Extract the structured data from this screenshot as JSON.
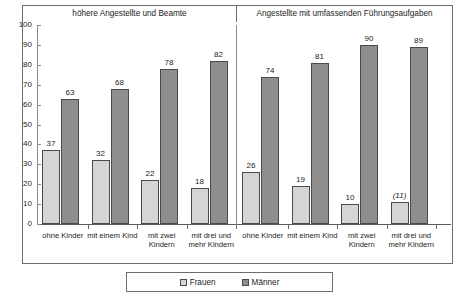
{
  "chart_data": {
    "type": "bar",
    "title": "",
    "xlabel": "",
    "ylabel": "",
    "ylim": [
      0,
      100
    ],
    "ytick_values": [
      0,
      10,
      20,
      30,
      40,
      50,
      60,
      70,
      80,
      90,
      100
    ],
    "ytick_labels": [
      "0",
      "10",
      "20",
      "30",
      "40",
      "50",
      "60",
      "70",
      "80",
      "90",
      "100"
    ],
    "grid": false,
    "legend_position": "bottom",
    "legend": [
      "Frauen",
      "Männer"
    ],
    "panels": [
      {
        "title": "höhere Angestellte und Beamte",
        "categories": [
          "ohne Kinder",
          "mit einem Kind",
          "mit zwei Kindern",
          "mit drei und mehr Kindern"
        ],
        "series": [
          {
            "name": "Frauen",
            "values": [
              37,
              32,
              22,
              18
            ],
            "labels": [
              "37",
              "32",
              "22",
              "18"
            ]
          },
          {
            "name": "Männer",
            "values": [
              63,
              68,
              78,
              82
            ],
            "labels": [
              "63",
              "68",
              "78",
              "82"
            ]
          }
        ]
      },
      {
        "title": "Angestellte mit umfassenden Führungsaufgaben",
        "categories": [
          "ohne Kinder",
          "mit einem Kind",
          "mit zwei Kindern",
          "mit drei und mehr Kindern"
        ],
        "series": [
          {
            "name": "Frauen",
            "values": [
              26,
              19,
              10,
              11
            ],
            "labels": [
              "26",
              "19",
              "10",
              "(11)"
            ],
            "estimated": [
              false,
              false,
              false,
              true
            ]
          },
          {
            "name": "Männer",
            "values": [
              74,
              81,
              90,
              89
            ],
            "labels": [
              "74",
              "81",
              "90",
              "89"
            ]
          }
        ]
      }
    ],
    "colors": {
      "frauen": "#d5d5d5",
      "maenner": "#8e8e8e",
      "bar_border": "#4a4a4a",
      "axis": "#6d6d6d",
      "text": "#1c1c1c"
    }
  }
}
